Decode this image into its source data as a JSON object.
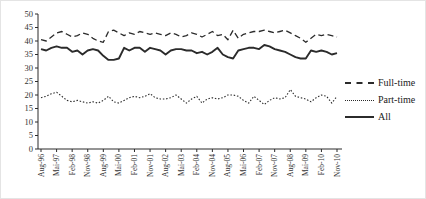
{
  "figure": {
    "kind": "line-chart",
    "background": "#ffffff",
    "line_color": "#2b2b2b",
    "text_color": "#333333"
  },
  "chart_data": {
    "type": "line",
    "title": "",
    "xlabel": "",
    "ylabel": "",
    "ylim": [
      0,
      50
    ],
    "ytick_step": 5,
    "ytick_labels": [
      "0",
      "5",
      "10",
      "15",
      "20",
      "25",
      "30",
      "35",
      "40",
      "45",
      "50"
    ],
    "grid": false,
    "legend_position": "right",
    "tick_every": 3,
    "xtick_labels_shown": [
      "Aug-96",
      "Mai-97",
      "Feb-98",
      "Nov-98",
      "Aug-99",
      "Mai-00",
      "Feb-01",
      "Nov-01",
      "Aug-02",
      "Mai-03",
      "Feb-04",
      "Nov-04",
      "Aug-05",
      "Mai-06",
      "Feb-07",
      "Nov-07",
      "Aug-08",
      "Mai-09",
      "Feb-10",
      "Nov-10"
    ],
    "categories": [
      "Aug-96",
      "Nov-96",
      "Feb-97",
      "Mai-97",
      "Aug-97",
      "Nov-97",
      "Feb-98",
      "Mai-98",
      "Aug-98",
      "Nov-98",
      "Feb-99",
      "Mai-99",
      "Aug-99",
      "Nov-99",
      "Feb-00",
      "Mai-00",
      "Aug-00",
      "Nov-00",
      "Feb-01",
      "Mai-01",
      "Aug-01",
      "Nov-01",
      "Feb-02",
      "Mai-02",
      "Aug-02",
      "Nov-02",
      "Feb-03",
      "Mai-03",
      "Aug-03",
      "Nov-03",
      "Feb-04",
      "Mai-04",
      "Aug-04",
      "Nov-04",
      "Feb-05",
      "Mai-05",
      "Aug-05",
      "Nov-05",
      "Feb-06",
      "Mai-06",
      "Aug-06",
      "Nov-06",
      "Feb-07",
      "Mai-07",
      "Aug-07",
      "Nov-07",
      "Feb-08",
      "Mai-08",
      "Aug-08",
      "Nov-08",
      "Feb-09",
      "Mai-09",
      "Aug-09",
      "Nov-09",
      "Feb-10",
      "Mai-10",
      "Aug-10",
      "Nov-10"
    ],
    "series": [
      {
        "name": "Full-time",
        "style": "dashed",
        "values": [
          40.5,
          40,
          41.5,
          43,
          43.5,
          42.5,
          41.5,
          42,
          43,
          42.5,
          41,
          40,
          39.5,
          43.5,
          44,
          43,
          42,
          43,
          42.5,
          43.5,
          43,
          42.5,
          43,
          42.5,
          42,
          43,
          42.5,
          41.5,
          42,
          43,
          42.5,
          41.5,
          42.5,
          43.5,
          42,
          42.5,
          40.5,
          44,
          41,
          42.5,
          43,
          43.5,
          43.5,
          44,
          43.5,
          43,
          43.5,
          44,
          43,
          42,
          41,
          39.5,
          41,
          42.5,
          42,
          42.5,
          42,
          41.5
        ]
      },
      {
        "name": "Part-time",
        "style": "dotted",
        "values": [
          19,
          19.5,
          20.5,
          21,
          19.5,
          18,
          17.5,
          18,
          17.5,
          17,
          17.5,
          17,
          18,
          19.5,
          17.5,
          17,
          18,
          19,
          19.5,
          19,
          19.5,
          20.5,
          19,
          18.5,
          18.5,
          19,
          20,
          18.5,
          17,
          18.5,
          19.5,
          17,
          18.5,
          19,
          18.5,
          19,
          20,
          20,
          19.5,
          18,
          17,
          19.5,
          18,
          16.5,
          18,
          19,
          18.5,
          19,
          22,
          19.5,
          19,
          18.5,
          17.5,
          19,
          20,
          19.5,
          17,
          19.5
        ]
      },
      {
        "name": "All",
        "style": "solid",
        "values": [
          37,
          36.5,
          37.5,
          38,
          37.5,
          37.5,
          36,
          36.5,
          35,
          36.5,
          37,
          36.5,
          34.5,
          33,
          33,
          33.5,
          37.5,
          36.5,
          37.5,
          37.5,
          36,
          37.5,
          37,
          36.5,
          35,
          36.5,
          37,
          37,
          36.5,
          36.5,
          35.5,
          36,
          35,
          36,
          37.5,
          35,
          34,
          33.5,
          36.5,
          37,
          37.5,
          37.5,
          37,
          38.5,
          38,
          37,
          36.5,
          36,
          35,
          34,
          33.5,
          33.5,
          36.5,
          36,
          36.5,
          36,
          35,
          35.5
        ]
      }
    ]
  },
  "legend": {
    "items": [
      {
        "label": "Full-time",
        "style": "dashed"
      },
      {
        "label": "Part-time",
        "style": "dotted"
      },
      {
        "label": "All",
        "style": "solid"
      }
    ]
  }
}
